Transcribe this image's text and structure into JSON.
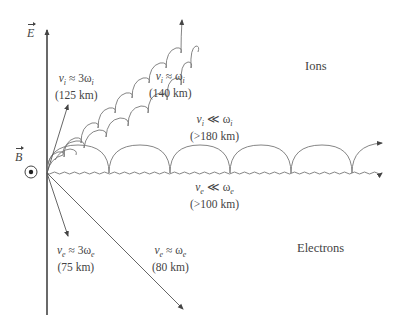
{
  "figure": {
    "axes": {
      "e_field_label": "E",
      "b_field_label": "B",
      "b_field_symbol": "out-of-page-dot-icon"
    },
    "regions": {
      "ions_label": "Ions",
      "electrons_label": "Electrons"
    },
    "trajectories": {
      "ion_3w": {
        "var": "v",
        "sub": "i",
        "relation": "≈ 3ω",
        "rel_sub": "i",
        "altitude": "(125 km)"
      },
      "ion_w": {
        "var": "v",
        "sub": "i",
        "relation": "≈ ω",
        "rel_sub": "i",
        "altitude": "(140 km)"
      },
      "ion_ll_w": {
        "var": "v",
        "sub": "i",
        "relation": "≪ ω",
        "rel_sub": "i",
        "altitude": "(>180 km)"
      },
      "electron_ll_w": {
        "var": "v",
        "sub": "e",
        "relation": "≪ ω",
        "rel_sub": "e",
        "altitude": "(>100 km)"
      },
      "electron_3w": {
        "var": "v",
        "sub": "e",
        "relation": "≈ 3ω",
        "rel_sub": "e",
        "altitude": "(75 km)"
      },
      "electron_w": {
        "var": "v",
        "sub": "e",
        "relation": "≈ ω",
        "rel_sub": "e",
        "altitude": "(80 km)"
      }
    },
    "colors": {
      "line": "#555555",
      "text": "#444444",
      "background": "#ffffff"
    }
  }
}
